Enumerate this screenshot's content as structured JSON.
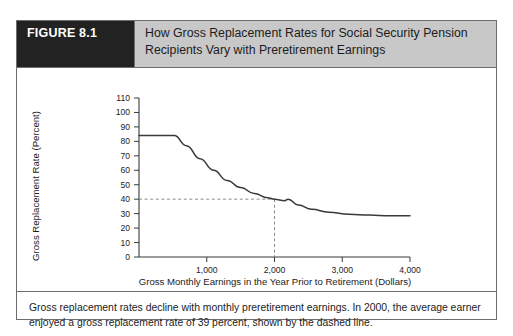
{
  "figure": {
    "badge_label": "FIGURE 8.1",
    "title_line1": "How Gross Replacement Rates for Social Security Pension",
    "title_line2": "Recipients Vary with Preretirement Earnings",
    "caption_line1": "Gross replacement rates decline with monthly preretirement earnings. In 2000, the average earner",
    "caption_line2": "enjoyed a gross replacement rate of 39 percent, shown by the dashed line.",
    "badge_bg": "#222222",
    "title_bg": "#c8c8c8",
    "border_color": "#6d6d6d"
  },
  "chart_data": {
    "type": "line",
    "title": "How Gross Replacement Rates for Social Security Pension Recipients Vary with Preretirement Earnings",
    "xlabel": "Gross Monthly Earnings in the Year Prior to Retirement (Dollars)",
    "ylabel": "Gross Replacement Rate (Percent)",
    "xlim": [
      0,
      4200
    ],
    "ylim": [
      0,
      110
    ],
    "grid": false,
    "legend": "none",
    "xticks": [
      0,
      1000,
      2000,
      3000,
      4000
    ],
    "xtick_labels": [
      "",
      "1,000",
      "2,000",
      "3,000",
      "4,000"
    ],
    "yticks": [
      0,
      10,
      20,
      30,
      40,
      50,
      60,
      70,
      80,
      90,
      100,
      110
    ],
    "ytick_labels": [
      "0",
      "10",
      "20",
      "30",
      "40",
      "50",
      "60",
      "70",
      "80",
      "90",
      "100",
      "110"
    ],
    "line_color": "#3a3a3a",
    "series": [
      {
        "name": "Gross replacement rate",
        "x": [
          0,
          520,
          700,
          900,
          1100,
          1300,
          1500,
          1700,
          1900,
          2000,
          2150,
          2200,
          2350,
          2550,
          2800,
          3100,
          3400,
          3700,
          4000
        ],
        "values": [
          84,
          84,
          77,
          68,
          60,
          53,
          48,
          44,
          41,
          40,
          39,
          40,
          36,
          33,
          31,
          29.5,
          29,
          28.5,
          28.5
        ]
      }
    ],
    "annotations": [
      {
        "name": "average-earner-dashed-marker",
        "type": "dashed-crosshair",
        "x": 2000,
        "y": 40,
        "label": "average earner, 39 percent",
        "color": "#8a8a8a"
      }
    ]
  }
}
